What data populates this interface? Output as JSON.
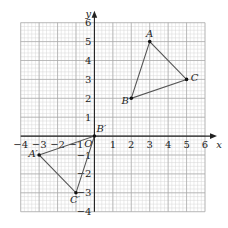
{
  "diagram": {
    "type": "coordinate-grid-reflection",
    "axes": {
      "x_label": "x",
      "y_label": "y",
      "origin_label": "O",
      "x_range": [
        -4,
        6
      ],
      "y_range": [
        -4,
        6
      ],
      "x_ticks": [
        "−4",
        "−3",
        "−2",
        "−1",
        "1",
        "2",
        "3",
        "4",
        "5",
        "6"
      ],
      "y_ticks": [
        "6",
        "5",
        "4",
        "3",
        "2",
        "1",
        "−1",
        "−2",
        "−3",
        "−4"
      ]
    },
    "triangle_original": {
      "points": [
        {
          "label": "A",
          "x": 3,
          "y": 5
        },
        {
          "label": "B",
          "x": 2,
          "y": 2
        },
        {
          "label": "C",
          "x": 5,
          "y": 3
        }
      ]
    },
    "triangle_image": {
      "points": [
        {
          "label": "A′",
          "x": -3,
          "y": -1
        },
        {
          "label": "B′",
          "x": 0,
          "y": 0
        },
        {
          "label": "C′",
          "x": -1,
          "y": -3
        }
      ]
    },
    "colors": {
      "grid_fine": "#d6d6d6",
      "grid_major": "#a8a8a8",
      "axis": "#222222",
      "triangle": "#555555"
    }
  }
}
